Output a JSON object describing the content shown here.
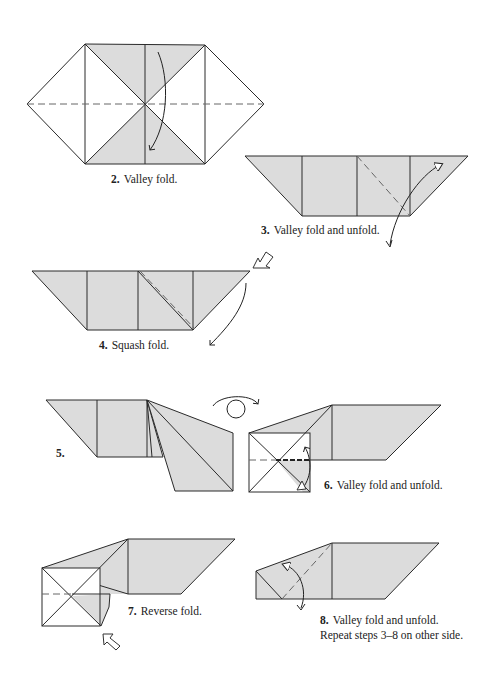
{
  "steps": [
    {
      "number": "2.",
      "instruction": "Valley fold."
    },
    {
      "number": "3.",
      "instruction": "Valley fold and unfold."
    },
    {
      "number": "4.",
      "instruction": "Squash fold."
    },
    {
      "number": "5.",
      "instruction": ""
    },
    {
      "number": "6.",
      "instruction": "Valley fold and unfold."
    },
    {
      "number": "7.",
      "instruction": "Reverse fold."
    },
    {
      "number": "8.",
      "instruction": "Valley fold and unfold.",
      "note": "Repeat steps 3–8 on other side."
    }
  ],
  "colors": {
    "paper_fill": "#dcdcdc",
    "line": "#2a2a2a",
    "background": "#ffffff"
  }
}
